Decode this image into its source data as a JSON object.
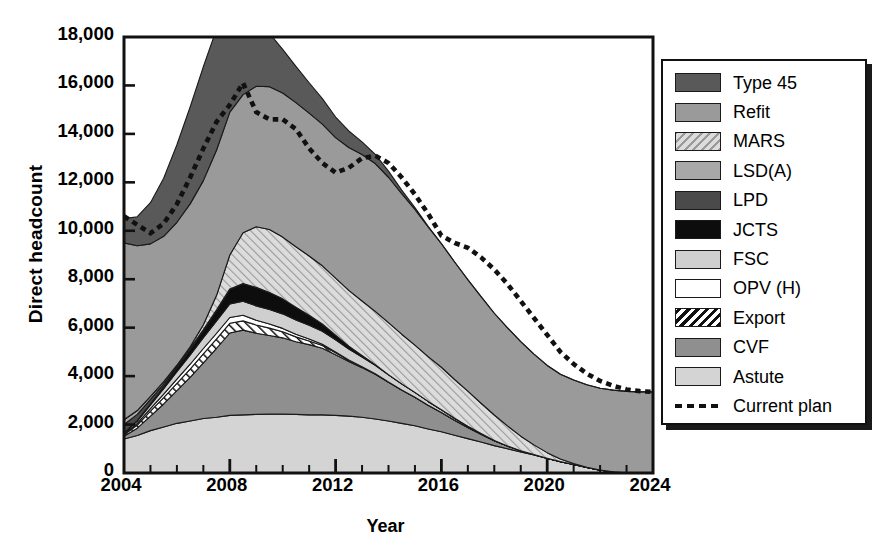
{
  "chart_data": {
    "type": "area",
    "title": "",
    "xlabel": "Year",
    "ylabel": "Direct headcount",
    "xlim": [
      2004,
      2024
    ],
    "ylim": [
      0,
      18000
    ],
    "ytick_values": [
      0,
      2000,
      4000,
      6000,
      8000,
      10000,
      12000,
      14000,
      16000,
      18000
    ],
    "ytick_labels": [
      "0",
      "2,000",
      "4,000",
      "6,000",
      "8,000",
      "10,000",
      "12,000",
      "14,000",
      "16,000",
      "18,000"
    ],
    "xtick_values": [
      2004,
      2008,
      2012,
      2016,
      2020,
      2024
    ],
    "xtick_labels": [
      "2004",
      "2008",
      "2012",
      "2016",
      "2020",
      "2024"
    ],
    "minor_xtick_interval": 1,
    "grid": false,
    "legend_position": "right-outside",
    "stack_order_bottom_to_top": [
      "Astute",
      "CVF",
      "Export",
      "OPV (H)",
      "FSC",
      "JCTS",
      "LPD",
      "LSD(A)",
      "MARS",
      "Refit",
      "Type 45"
    ],
    "x": [
      2004,
      2004.5,
      2005,
      2005.5,
      2006,
      2006.5,
      2007,
      2007.5,
      2008,
      2008.5,
      2009,
      2009.5,
      2010,
      2010.5,
      2011,
      2011.5,
      2012,
      2012.5,
      2013,
      2013.5,
      2014,
      2014.5,
      2015,
      2015.5,
      2016,
      2016.5,
      2017,
      2017.5,
      2018,
      2018.5,
      2019,
      2019.5,
      2020,
      2020.5,
      2021,
      2021.5,
      2022,
      2022.5,
      2023,
      2023.5,
      2024
    ],
    "series": [
      {
        "name": "Astute",
        "fill": "#d4d4d4",
        "pattern": "solid",
        "values": [
          1400,
          1550,
          1750,
          1900,
          2050,
          2150,
          2250,
          2300,
          2380,
          2400,
          2420,
          2430,
          2430,
          2420,
          2400,
          2400,
          2380,
          2350,
          2300,
          2230,
          2150,
          2050,
          1950,
          1820,
          1700,
          1560,
          1420,
          1280,
          1130,
          1000,
          870,
          740,
          600,
          470,
          350,
          230,
          120,
          50,
          10,
          0,
          0
        ]
      },
      {
        "name": "CVF",
        "fill": "#8f8f8f",
        "pattern": "solid",
        "values": [
          120,
          300,
          600,
          950,
          1350,
          1800,
          2300,
          2850,
          3400,
          3500,
          3350,
          3250,
          3150,
          3000,
          2900,
          2750,
          2500,
          2250,
          2050,
          1850,
          1600,
          1380,
          1180,
          980,
          800,
          620,
          460,
          320,
          200,
          110,
          50,
          20,
          10,
          0,
          0,
          0,
          0,
          0,
          0,
          0,
          0
        ]
      },
      {
        "name": "Export",
        "fill": "#ffffff",
        "pattern": "hatch-black",
        "values": [
          60,
          130,
          200,
          260,
          300,
          340,
          370,
          390,
          400,
          380,
          340,
          300,
          250,
          200,
          150,
          110,
          80,
          50,
          30,
          15,
          5,
          0,
          0,
          0,
          0,
          0,
          0,
          0,
          0,
          0,
          0,
          0,
          0,
          0,
          0,
          0,
          0,
          0,
          0,
          0,
          0
        ]
      },
      {
        "name": "OPV (H)",
        "fill": "#ffffff",
        "pattern": "solid",
        "values": [
          30,
          70,
          110,
          150,
          180,
          200,
          220,
          230,
          240,
          230,
          200,
          170,
          140,
          110,
          80,
          55,
          35,
          20,
          10,
          5,
          0,
          0,
          0,
          0,
          0,
          0,
          0,
          0,
          0,
          0,
          0,
          0,
          0,
          0,
          0,
          0,
          0,
          0,
          0,
          0,
          0
        ]
      },
      {
        "name": "FSC",
        "fill": "#cfcfcf",
        "pattern": "solid",
        "values": [
          40,
          90,
          150,
          220,
          300,
          380,
          450,
          510,
          560,
          580,
          590,
          600,
          600,
          590,
          570,
          540,
          500,
          450,
          400,
          350,
          300,
          250,
          200,
          155,
          115,
          80,
          50,
          30,
          15,
          5,
          0,
          0,
          0,
          0,
          0,
          0,
          0,
          0,
          0,
          0,
          0
        ]
      },
      {
        "name": "JCTS",
        "fill": "#0d0d0d",
        "pattern": "solid",
        "values": [
          0,
          20,
          50,
          90,
          140,
          200,
          280,
          420,
          600,
          720,
          760,
          700,
          620,
          520,
          410,
          300,
          200,
          120,
          60,
          25,
          5,
          0,
          0,
          0,
          0,
          0,
          0,
          0,
          0,
          0,
          0,
          0,
          0,
          0,
          0,
          0,
          0,
          0,
          0,
          0,
          0
        ]
      },
      {
        "name": "LPD",
        "fill": "#4a4a4a",
        "pattern": "solid",
        "values": [
          350,
          260,
          180,
          110,
          60,
          30,
          15,
          10,
          5,
          0,
          0,
          0,
          0,
          0,
          0,
          0,
          0,
          0,
          0,
          0,
          0,
          0,
          0,
          0,
          0,
          0,
          0,
          0,
          0,
          0,
          0,
          0,
          0,
          0,
          0,
          0,
          0,
          0,
          0,
          0,
          0
        ]
      },
      {
        "name": "LSD(A)",
        "fill": "#a8a8a8",
        "pattern": "solid",
        "values": [
          200,
          160,
          120,
          90,
          70,
          50,
          35,
          25,
          15,
          10,
          5,
          0,
          0,
          0,
          0,
          0,
          0,
          0,
          0,
          0,
          0,
          0,
          0,
          0,
          0,
          0,
          0,
          0,
          0,
          0,
          0,
          0,
          0,
          0,
          0,
          0,
          0,
          0,
          0,
          0,
          0
        ]
      },
      {
        "name": "MARS",
        "fill": "#c9c9c9",
        "pattern": "hatch-gray",
        "values": [
          0,
          0,
          0,
          0,
          0,
          60,
          200,
          600,
          1400,
          2100,
          2500,
          2600,
          2550,
          2500,
          2450,
          2400,
          2350,
          2300,
          2250,
          2200,
          2150,
          2050,
          1950,
          1850,
          1750,
          1600,
          1450,
          1250,
          1050,
          830,
          600,
          400,
          230,
          110,
          40,
          10,
          0,
          0,
          0,
          0,
          0
        ]
      },
      {
        "name": "Refit",
        "fill": "#9a9a9a",
        "pattern": "solid",
        "values": [
          7300,
          6800,
          6300,
          6000,
          5900,
          5900,
          5950,
          6000,
          5900,
          5700,
          5800,
          5900,
          5950,
          5950,
          5900,
          5850,
          5800,
          5900,
          6050,
          6100,
          6000,
          5800,
          5600,
          5350,
          5100,
          4850,
          4600,
          4400,
          4200,
          4050,
          3900,
          3750,
          3600,
          3500,
          3450,
          3400,
          3380,
          3370,
          3360,
          3350,
          3350
        ]
      },
      {
        "name": "Type 45",
        "fill": "#595959",
        "pattern": "solid",
        "values": [
          1000,
          1200,
          1700,
          2400,
          3200,
          4000,
          4700,
          5000,
          4800,
          3700,
          2800,
          2200,
          1800,
          1500,
          1250,
          1050,
          850,
          680,
          520,
          380,
          250,
          150,
          80,
          30,
          10,
          0,
          0,
          0,
          0,
          0,
          0,
          0,
          0,
          0,
          0,
          0,
          0,
          0,
          0,
          0,
          0
        ]
      }
    ],
    "overlay_line": {
      "name": "Current plan",
      "style": "dotted",
      "color": "#111111",
      "values": [
        10600,
        10250,
        9900,
        10300,
        11100,
        12200,
        13400,
        14500,
        15200,
        16100,
        14900,
        14600,
        14600,
        14200,
        13400,
        12800,
        12400,
        12600,
        13000,
        13100,
        12800,
        12200,
        11500,
        10700,
        9800,
        9500,
        9300,
        8900,
        8400,
        7800,
        7100,
        6400,
        5700,
        5000,
        4500,
        4100,
        3800,
        3600,
        3450,
        3380,
        3350
      ]
    }
  },
  "legend": {
    "items": [
      {
        "label": "Type 45",
        "swatch": "#595959",
        "pattern": "solid"
      },
      {
        "label": "Refit",
        "swatch": "#9a9a9a",
        "pattern": "solid"
      },
      {
        "label": "MARS",
        "swatch": "#c9c9c9",
        "pattern": "hatch-gray"
      },
      {
        "label": "LSD(A)",
        "swatch": "#a8a8a8",
        "pattern": "solid"
      },
      {
        "label": "LPD",
        "swatch": "#4a4a4a",
        "pattern": "solid"
      },
      {
        "label": "JCTS",
        "swatch": "#0d0d0d",
        "pattern": "solid"
      },
      {
        "label": "FSC",
        "swatch": "#cfcfcf",
        "pattern": "solid"
      },
      {
        "label": "OPV (H)",
        "swatch": "#ffffff",
        "pattern": "solid"
      },
      {
        "label": "Export",
        "swatch": "#ffffff",
        "pattern": "hatch-black"
      },
      {
        "label": "CVF",
        "swatch": "#8f8f8f",
        "pattern": "solid"
      },
      {
        "label": "Astute",
        "swatch": "#d4d4d4",
        "pattern": "solid"
      },
      {
        "label": "Current plan",
        "swatch": "",
        "pattern": "dotted-line"
      }
    ]
  }
}
